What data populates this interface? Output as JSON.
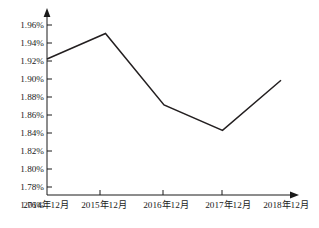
{
  "chart_data": {
    "type": "line",
    "title": "",
    "subtitle": "",
    "xlabel": "",
    "ylabel": "",
    "categories": [
      "2014年12月",
      "2015年12月",
      "2016年12月",
      "2017年12月",
      "2018年12月"
    ],
    "values": [
      1.92,
      1.95,
      1.866,
      1.836,
      1.895
    ],
    "value_labels": [
      "1.92%",
      "1.95%",
      "1.866%",
      "1.836%",
      "1.895%"
    ],
    "ylim": [
      1.76,
      1.96
    ],
    "ytick_values": [
      1.96,
      1.94,
      1.92,
      1.9,
      1.88,
      1.86,
      1.84,
      1.82,
      1.8,
      1.78,
      1.76
    ],
    "ytick_labels": [
      "1.96%",
      "1.94%",
      "1.92%",
      "1.90%",
      "1.88%",
      "1.86%",
      "1.84%",
      "1.82%",
      "1.80%",
      "1.78%",
      "1.76%"
    ],
    "xtick_labels": [
      "2014年12月",
      "2015年12月",
      "2016年12月",
      "2017年12月",
      "2018年12月"
    ],
    "grid": false,
    "legend": [],
    "legend_position": "none",
    "series_color": "#231f20",
    "axis_color": "#1a1a1a",
    "background_color": "#ffffff",
    "marker": "none",
    "annotations": []
  },
  "axis": {
    "y_arrow_icon": "axis-arrow-up-icon",
    "x_arrow_icon": "axis-arrow-right-icon"
  }
}
